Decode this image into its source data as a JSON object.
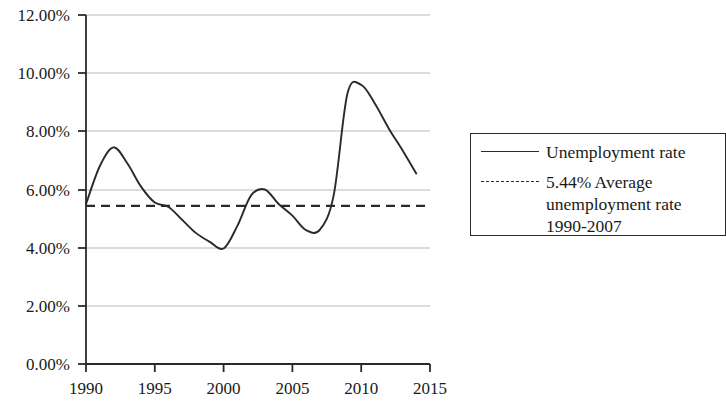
{
  "chart_data": {
    "type": "line",
    "title": "",
    "xlabel": "",
    "ylabel": "",
    "xlim": [
      1990,
      2015
    ],
    "ylim": [
      0,
      12
    ],
    "grid": true,
    "x_ticks": [
      "1990",
      "1995",
      "2000",
      "2005",
      "2010",
      "2015"
    ],
    "x_tick_values": [
      1990,
      1995,
      2000,
      2005,
      2010,
      2015
    ],
    "y_ticks": [
      "0.00%",
      "2.00%",
      "4.00%",
      "6.00%",
      "8.00%",
      "10.00%",
      "12.00%"
    ],
    "y_tick_values": [
      0,
      2,
      4,
      6,
      8,
      10,
      12
    ],
    "legend_position": "right",
    "series": [
      {
        "name": "Unemployment rate",
        "style": "solid",
        "color": "#2a2a2a",
        "x": [
          1990,
          1991,
          1992,
          1993,
          1994,
          1995,
          1996,
          1997,
          1998,
          1999,
          2000,
          2001,
          2002,
          2003,
          2004,
          2005,
          2006,
          2007,
          2008,
          2009,
          2010,
          2011,
          2012,
          2013,
          2014
        ],
        "values": [
          5.5,
          6.8,
          7.45,
          6.9,
          6.1,
          5.55,
          5.4,
          4.95,
          4.5,
          4.2,
          3.97,
          4.75,
          5.8,
          6.0,
          5.5,
          5.1,
          4.6,
          4.62,
          5.8,
          9.3,
          9.6,
          8.95,
          8.1,
          7.35,
          6.55
        ],
        "annotations": [
          {
            "label": "1992 peak",
            "x": 1992,
            "y": 7.45
          },
          {
            "label": "2000 trough",
            "x": 2000,
            "y": 3.97
          },
          {
            "label": "2003 local peak",
            "x": 2003,
            "y": 6.0
          },
          {
            "label": "2006 trough",
            "x": 2006,
            "y": 4.6
          },
          {
            "label": "2010 peak",
            "x": 2010,
            "y": 9.6
          }
        ]
      },
      {
        "name": "5.44% Average unemployment rate 1990-2007",
        "style": "dashed",
        "color": "#2a2a2a",
        "type": "horizontal-reference-line",
        "value": 5.44
      }
    ]
  },
  "legend": {
    "entries": [
      {
        "sample": "solid-line",
        "label": "Unemployment rate"
      },
      {
        "sample": "dashed-line",
        "label": "5.44% Average\nunemployment rate\n1990-2007"
      }
    ]
  },
  "axes": {
    "y_labels": [
      "12.00%",
      "10.00%",
      "8.00%",
      "6.00%",
      "4.00%",
      "2.00%",
      "0.00%"
    ],
    "x_labels": [
      "1990",
      "1995",
      "2000",
      "2005",
      "2010",
      "2015"
    ]
  }
}
